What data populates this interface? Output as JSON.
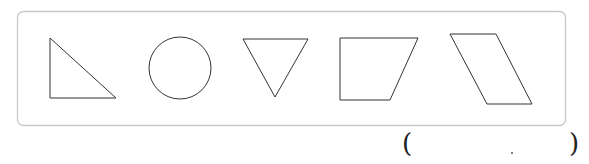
{
  "figure": {
    "shapes": [
      {
        "name": "right-triangle",
        "label": "right triangle"
      },
      {
        "name": "circle",
        "label": "circle"
      },
      {
        "name": "inverted-triangle",
        "label": "triangle"
      },
      {
        "name": "trapezoid",
        "label": "right trapezoid"
      },
      {
        "name": "parallelogram",
        "label": "parallelogram"
      }
    ],
    "stroke_color": "#333333",
    "frame_color": "#c8c8c8"
  },
  "answer": {
    "open_paren": "(",
    "close_paren": ")",
    "value": ""
  }
}
